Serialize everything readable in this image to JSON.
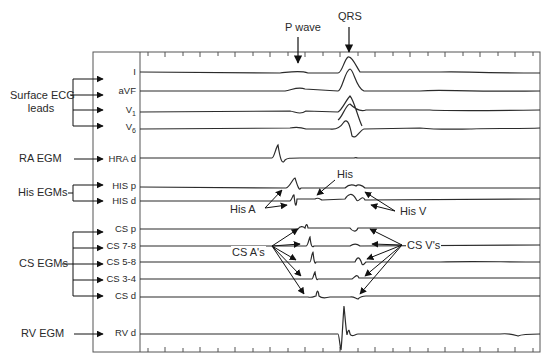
{
  "top_annotations": {
    "p_wave": "P wave",
    "qrs": "QRS"
  },
  "groups": [
    {
      "label": "Surface ECG",
      "label_line2": "leads"
    },
    {
      "label": "RA EGM"
    },
    {
      "label": "His EGMs"
    },
    {
      "label": "CS EGMs"
    },
    {
      "label": "RV EGM"
    }
  ],
  "channels": [
    {
      "name": "I",
      "sub": ""
    },
    {
      "name": "aVF",
      "sub": ""
    },
    {
      "name": "V",
      "sub": "1"
    },
    {
      "name": "V",
      "sub": "6"
    },
    {
      "name": "HRA d",
      "sub": ""
    },
    {
      "name": "HIS p",
      "sub": ""
    },
    {
      "name": "HIS d",
      "sub": ""
    },
    {
      "name": "CS p",
      "sub": ""
    },
    {
      "name": "CS 7-8",
      "sub": ""
    },
    {
      "name": "CS 5-8",
      "sub": ""
    },
    {
      "name": "CS 3-4",
      "sub": ""
    },
    {
      "name": "CS d",
      "sub": ""
    },
    {
      "name": "RV d",
      "sub": ""
    }
  ],
  "inner_annotations": {
    "his": "His",
    "his_a": "His A",
    "his_v": "His V",
    "cs_a": "CS A's",
    "cs_v": "CS V's"
  },
  "colors": {
    "trace": "#2b2b2b",
    "frame": "#555555",
    "text": "#2a2a2a"
  }
}
